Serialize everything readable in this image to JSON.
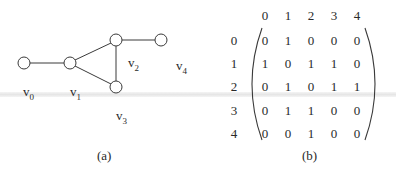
{
  "panel_a": {
    "caption": "(a)",
    "nodes": [
      {
        "id": "v0",
        "letter": "v",
        "sub": "0"
      },
      {
        "id": "v1",
        "letter": "v",
        "sub": "1"
      },
      {
        "id": "v2",
        "letter": "v",
        "sub": "2"
      },
      {
        "id": "v3",
        "letter": "v",
        "sub": "3"
      },
      {
        "id": "v4",
        "letter": "v",
        "sub": "4"
      }
    ],
    "edges": [
      [
        "v0",
        "v1"
      ],
      [
        "v1",
        "v2"
      ],
      [
        "v1",
        "v3"
      ],
      [
        "v2",
        "v3"
      ],
      [
        "v2",
        "v4"
      ]
    ]
  },
  "panel_b": {
    "caption": "(b)",
    "col_headers": [
      "0",
      "1",
      "2",
      "3",
      "4"
    ],
    "row_headers": [
      "0",
      "1",
      "2",
      "3",
      "4"
    ],
    "matrix": [
      [
        "0",
        "1",
        "0",
        "0",
        "0"
      ],
      [
        "1",
        "0",
        "1",
        "1",
        "0"
      ],
      [
        "0",
        "1",
        "0",
        "1",
        "1"
      ],
      [
        "0",
        "1",
        "1",
        "0",
        "0"
      ],
      [
        "0",
        "0",
        "1",
        "0",
        "0"
      ]
    ]
  },
  "colors": {
    "stroke": "#3a3a3a",
    "text": "#2a2a2a",
    "band": "#e6e6e6"
  }
}
